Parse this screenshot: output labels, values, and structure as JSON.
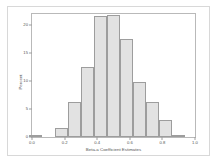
{
  "chart_data": {
    "type": "bar",
    "title": "",
    "subtitle": "",
    "xlabel": "Beta-a Coefficient Estimates",
    "ylabel": "Percent",
    "grid": false,
    "legend": false,
    "xlim": [
      0.0,
      1.0
    ],
    "ylim": [
      0,
      22
    ],
    "xticks": [
      "0.0",
      "0.2",
      "0.4",
      "0.6",
      "0.8",
      "1.0"
    ],
    "xtick_values": [
      0.0,
      0.2,
      0.4,
      0.6,
      0.8,
      1.0
    ],
    "yticks": [
      "0",
      "5",
      "10",
      "15",
      "20"
    ],
    "ytick_values": [
      0,
      5,
      10,
      15,
      20
    ],
    "bin_width": 0.08,
    "bar_color": "#e2e2e2",
    "bar_edge_color": "#9d9d9d",
    "categories": [
      "0.02",
      "0.10",
      "0.18",
      "0.26",
      "0.34",
      "0.42",
      "0.50",
      "0.58",
      "0.66",
      "0.74",
      "0.82",
      "0.90"
    ],
    "bin_centers": [
      0.02,
      0.1,
      0.18,
      0.26,
      0.34,
      0.42,
      0.5,
      0.58,
      0.66,
      0.74,
      0.82,
      0.9
    ],
    "values": [
      0.3,
      0.0,
      1.6,
      6.3,
      12.5,
      21.6,
      21.8,
      17.5,
      9.8,
      6.3,
      3.0,
      0.3
    ]
  },
  "axes": {
    "ylabel": "Percent",
    "xlabel": "Beta-a Coefficient Estimates"
  }
}
